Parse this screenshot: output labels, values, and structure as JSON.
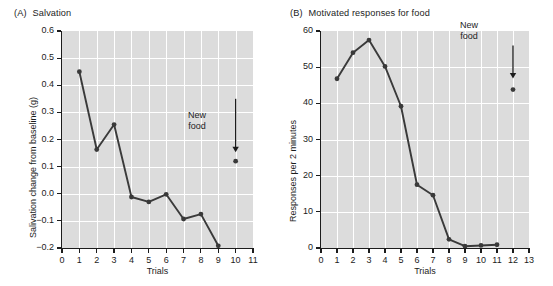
{
  "figure": {
    "background": "#ffffff",
    "plot_background": "#dcdcdc",
    "grid_color": "#ffffff",
    "series_color": "#3a3a3a",
    "axis_color": "#1c1c1c"
  },
  "panels": {
    "a": {
      "tag": "(A)",
      "title": "Salvation",
      "xlabel": "Trials",
      "ylabel": "Salivation change from baseline (g)",
      "annotation": {
        "line1": "New",
        "line2": "food"
      }
    },
    "b": {
      "tag": "(B)",
      "title": "Motivated responses for food",
      "xlabel": "Trials",
      "ylabel": "Responses per 2 minutes",
      "annotation": {
        "line1": "New",
        "line2": "food"
      }
    }
  },
  "chart_data": [
    {
      "id": "panel-a",
      "type": "line",
      "title": "(A)  Salvation",
      "xlabel": "Trials",
      "ylabel": "Salivation change from baseline (g)",
      "xlim": [
        0,
        11
      ],
      "ylim": [
        -0.2,
        0.6
      ],
      "xticks": [
        0,
        1,
        2,
        3,
        4,
        5,
        6,
        7,
        8,
        9,
        10,
        11
      ],
      "xticklabels": [
        "0",
        "1",
        "2",
        "3",
        "4",
        "5",
        "6",
        "7",
        "8",
        "9",
        "10",
        "11"
      ],
      "yticks": [
        -0.2,
        -0.1,
        0.0,
        0.1,
        0.2,
        0.3,
        0.4,
        0.5,
        0.6
      ],
      "yticklabels": [
        "−0.2",
        "−0.1",
        "0.0",
        "0.1",
        "0.2",
        "0.3",
        "0.4",
        "0.5",
        "0.6"
      ],
      "grid": true,
      "legend": "none",
      "series": [
        {
          "name": "Salivation change",
          "x": [
            1,
            2,
            3,
            4,
            5,
            6,
            7,
            8,
            9
          ],
          "values": [
            0.45,
            0.163,
            0.255,
            -0.012,
            -0.03,
            -0.002,
            -0.093,
            -0.075,
            -0.192
          ]
        }
      ],
      "extra_points": [
        {
          "name": "New food",
          "x": 10,
          "y": 0.12,
          "label": "New food"
        }
      ],
      "annotations": [
        {
          "text": "New food",
          "x": 10,
          "y": 0.35,
          "arrow_to": [
            10,
            0.155
          ]
        }
      ]
    },
    {
      "id": "panel-b",
      "type": "line",
      "title": "(B)  Motivated responses for food",
      "xlabel": "Trials",
      "ylabel": "Responses per 2 minutes",
      "xlim": [
        0,
        13
      ],
      "ylim": [
        0,
        60
      ],
      "xticks": [
        0,
        1,
        2,
        3,
        4,
        5,
        6,
        7,
        8,
        9,
        10,
        11,
        12,
        13
      ],
      "xticklabels": [
        "0",
        "1",
        "2",
        "3",
        "4",
        "5",
        "6",
        "7",
        "8",
        "9",
        "10",
        "11",
        "12",
        "13"
      ],
      "yticks": [
        0,
        10,
        20,
        30,
        40,
        50,
        60
      ],
      "yticklabels": [
        "0",
        "10",
        "20",
        "30",
        "40",
        "50",
        "60"
      ],
      "grid": true,
      "legend": "none",
      "series": [
        {
          "name": "Responses per 2 minutes",
          "x": [
            1,
            2,
            3,
            4,
            5,
            6,
            7,
            8,
            9,
            10,
            11
          ],
          "values": [
            46.8,
            54.0,
            57.5,
            50.2,
            39.2,
            17.5,
            14.6,
            2.4,
            0.5,
            0.7,
            0.9
          ]
        }
      ],
      "extra_points": [
        {
          "name": "New food",
          "x": 12,
          "y": 43.8,
          "label": "New food"
        }
      ],
      "annotations": [
        {
          "text": "New food",
          "x": 12,
          "y": 56,
          "arrow_to": [
            12,
            47
          ]
        }
      ]
    }
  ]
}
